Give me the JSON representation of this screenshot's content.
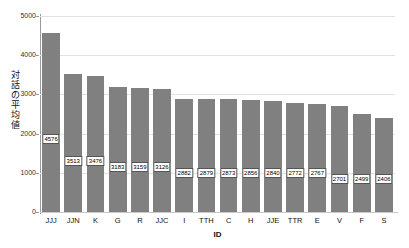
{
  "chart_data": {
    "type": "bar",
    "title": "",
    "xlabel": "ID",
    "ylabel": "対話の平均値",
    "categories": [
      "JJJ",
      "JJN",
      "K",
      "G",
      "R",
      "JJC",
      "I",
      "TTH",
      "C",
      "H",
      "JJE",
      "TTR",
      "E",
      "V",
      "F",
      "S"
    ],
    "values": [
      4576,
      3513,
      3476,
      3183,
      3159,
      3126,
      2882,
      2879,
      2873,
      2856,
      2840,
      2772,
      2767,
      2701,
      2499,
      2406
    ],
    "data_labels": [
      "4576",
      "3513",
      "3476",
      "3183",
      "3159",
      "3126",
      "2882",
      "2879",
      "2873",
      "2856",
      "2840",
      "2772",
      "2767",
      "2701",
      "2499",
      "2406"
    ],
    "ylim": [
      0,
      5000
    ],
    "yticks": [
      0,
      1000,
      2000,
      3000,
      4000,
      5000
    ],
    "ytick_labels": [
      "0",
      "1000",
      "2000",
      "3000",
      "4000",
      "5000"
    ],
    "grid": true,
    "legend": "none",
    "bar_color": "#808080",
    "grid_color": "#e2e2e2",
    "axis_color": "#9a9a9a",
    "background": "#ffffff"
  }
}
